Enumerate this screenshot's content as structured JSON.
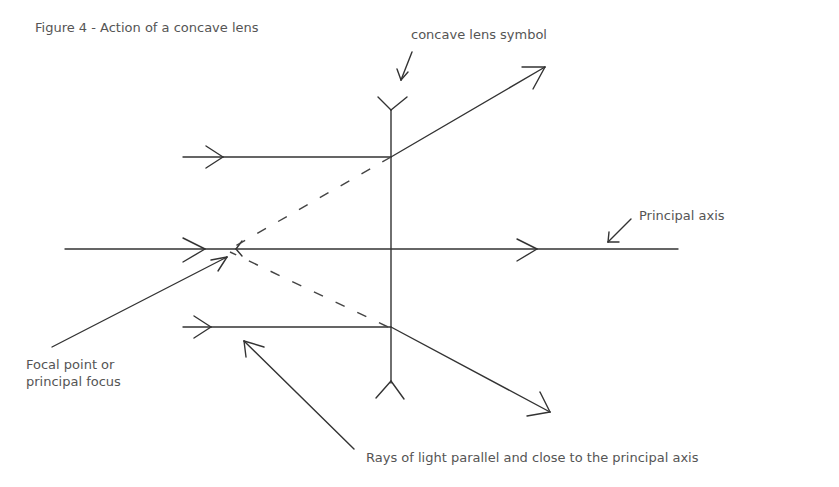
{
  "figure": {
    "title": "Figure 4 - Action of a concave lens"
  },
  "labels": {
    "lens_symbol": "concave lens symbol",
    "principal_axis": "Principal axis",
    "focal_point_line1": "Focal point or",
    "focal_point_line2": "principal focus",
    "rays": "Rays of light parallel and close to the principal axis"
  },
  "diagram": {
    "lens": {
      "x": 391,
      "y_top": 100,
      "y_bottom": 395,
      "type": "concave"
    },
    "principal_axis": {
      "y": 249,
      "x_start": 65,
      "x_end": 678
    },
    "focal_point": {
      "x": 230,
      "y": 249
    },
    "rays": [
      {
        "name": "upper-ray",
        "incident_y": 157,
        "refracted_to": [
          545,
          67
        ]
      },
      {
        "name": "axial-ray",
        "incident_y": 249,
        "refracted_to": [
          678,
          249
        ]
      },
      {
        "name": "lower-ray",
        "incident_y": 327,
        "refracted_to": [
          550,
          412
        ]
      }
    ],
    "colors": {
      "line": "#333333",
      "text": "#555555",
      "background": "#ffffff"
    }
  }
}
